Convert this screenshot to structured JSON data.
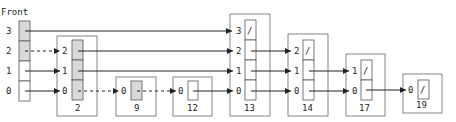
{
  "diagram": {
    "type": "skip-list",
    "front_label": "Front",
    "front_levels": [
      "3",
      "2",
      "1",
      "0"
    ],
    "colors": {
      "line": "#333333",
      "box_border": "#555555",
      "visited_cell": "#d9d9d9",
      "empty_cell": "#ffffff",
      "background": "#ffffff"
    },
    "nodes": [
      {
        "key": "2",
        "levels": [
          "2",
          "1",
          "0"
        ],
        "shaded": [
          true,
          true,
          true
        ]
      },
      {
        "key": "9",
        "levels": [
          "0"
        ],
        "shaded": [
          true
        ]
      },
      {
        "key": "12",
        "levels": [
          "0"
        ],
        "shaded": [
          false
        ]
      },
      {
        "key": "13",
        "levels": [
          "3",
          "2",
          "1",
          "0"
        ],
        "shaded": [
          false,
          false,
          false,
          false
        ],
        "null_levels": [
          "3"
        ]
      },
      {
        "key": "14",
        "levels": [
          "2",
          "1",
          "0"
        ],
        "shaded": [
          false,
          false,
          false
        ],
        "null_levels": [
          "2"
        ]
      },
      {
        "key": "17",
        "levels": [
          "1",
          "0"
        ],
        "shaded": [
          false,
          false
        ],
        "null_levels": [
          "1"
        ]
      },
      {
        "key": "19",
        "levels": [
          "0"
        ],
        "shaded": [
          false
        ],
        "null_levels": [
          "0"
        ]
      }
    ],
    "null_marker": "/",
    "links": [
      {
        "from": "Front",
        "level": "3",
        "to": "13",
        "style": "solid"
      },
      {
        "from": "Front",
        "level": "2",
        "to": "2",
        "style": "dashed"
      },
      {
        "from": "Front",
        "level": "1",
        "to": "2",
        "style": "solid"
      },
      {
        "from": "Front",
        "level": "0",
        "to": "2",
        "style": "solid"
      },
      {
        "from": "2",
        "level": "2",
        "to": "13",
        "style": "solid"
      },
      {
        "from": "2",
        "level": "1",
        "to": "13",
        "style": "solid"
      },
      {
        "from": "2",
        "level": "0",
        "to": "9",
        "style": "dashed"
      },
      {
        "from": "9",
        "level": "0",
        "to": "12",
        "style": "dashed"
      },
      {
        "from": "12",
        "level": "0",
        "to": "13",
        "style": "solid"
      },
      {
        "from": "13",
        "level": "2",
        "to": "14",
        "style": "solid"
      },
      {
        "from": "13",
        "level": "1",
        "to": "14",
        "style": "solid"
      },
      {
        "from": "13",
        "level": "0",
        "to": "14",
        "style": "solid"
      },
      {
        "from": "14",
        "level": "1",
        "to": "17",
        "style": "solid"
      },
      {
        "from": "14",
        "level": "0",
        "to": "17",
        "style": "solid"
      },
      {
        "from": "17",
        "level": "0",
        "to": "19",
        "style": "solid"
      }
    ]
  }
}
